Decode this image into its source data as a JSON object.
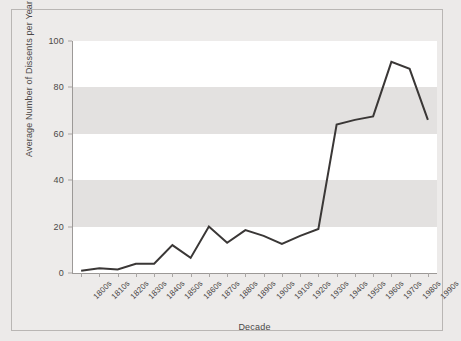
{
  "chart_data": {
    "type": "line",
    "title": "",
    "xlabel": "Decade",
    "ylabel": "Average Number of Dissents per Year",
    "categories": [
      "1800s",
      "1810s",
      "1820s",
      "1830s",
      "1840s",
      "1850s",
      "1860s",
      "1870s",
      "1880s",
      "1890s",
      "1900s",
      "1910s",
      "1920s",
      "1930s",
      "1940s",
      "1950s",
      "1960s",
      "1970s",
      "1980s",
      "1990s"
    ],
    "values": [
      1,
      2,
      1.5,
      4,
      4,
      12,
      6.5,
      20,
      13,
      18.5,
      16,
      12.5,
      16,
      19,
      64,
      66,
      67.5,
      91,
      88,
      66
    ],
    "yticks": [
      0,
      20,
      40,
      60,
      80,
      100
    ],
    "ytick_labels": [
      "0",
      "20",
      "40",
      "60",
      "80",
      "100"
    ],
    "ylim": [
      0,
      100
    ],
    "grid": false,
    "banded_background": true,
    "legend": null,
    "line_color": "#3a3736",
    "band_color": "#e3e1e0",
    "plot_background": "#ffffff",
    "figure_background": "#eceae9",
    "frame_color": "#b9b6b4",
    "text_color": "#4b4847"
  }
}
